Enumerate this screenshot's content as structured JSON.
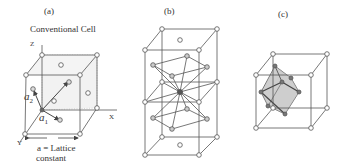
{
  "figure": {
    "panels": [
      {
        "id": "a",
        "label": "(a)",
        "title": "Conventional Cell",
        "axes": {
          "z": "Z",
          "x": "X",
          "y": "Y"
        },
        "vectors": [
          {
            "symbol": "a",
            "subscript": "1"
          },
          {
            "symbol": "a",
            "subscript": "2"
          },
          {
            "symbol": "a",
            "subscript": "3"
          }
        ],
        "caption_line1": "a = Lattice",
        "caption_line2": "constant",
        "description": "Face-centered cubic conventional cell with primitive vectors a1, a2, a3"
      },
      {
        "id": "b",
        "label": "(b)",
        "description": "Stacked cubic cells with central atom bonded to neighbors"
      },
      {
        "id": "c",
        "label": "(c)",
        "description": "Cubic cell with shaded hexagonal plane section"
      }
    ],
    "colors": {
      "line": "#444444",
      "atom_fill": "#ffffff",
      "atom_dark": "#555555",
      "shade": "#cfcfcf",
      "dashed_face": "#bbbbbb"
    }
  }
}
